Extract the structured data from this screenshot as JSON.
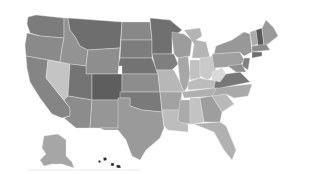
{
  "map": {
    "type": "choropleth",
    "region": "United States",
    "color_scheme": "grayscale",
    "background": "#ffffff",
    "states": [
      {
        "id": "WA",
        "fill": "#7c7c7c",
        "points": "28,17 36,15 64,18 64,38 40,36 30,33 27,24"
      },
      {
        "id": "OR",
        "fill": "#8a8a8a",
        "points": "27,33 40,36 64,38 62,48 60,62 26,56 25,45"
      },
      {
        "id": "CA",
        "fill": "#858585",
        "points": "26,56 48,60 46,78 70,108 70,116 62,118 52,114 40,98 30,82 27,68"
      },
      {
        "id": "NV",
        "fill": "#c4c4c4",
        "points": "48,60 70,64 68,96 64,100 46,78"
      },
      {
        "id": "ID",
        "fill": "#939393",
        "points": "64,18 68,18 70,30 76,38 80,46 88,50 86,66 70,64 60,62 62,48 64,38"
      },
      {
        "id": "MT",
        "fill": "#6e6e6e",
        "points": "68,18 122,22 120,48 88,50 80,46 76,38 70,30"
      },
      {
        "id": "WY",
        "fill": "#8e8e8e",
        "points": "88,50 120,48 118,74 86,74 86,66"
      },
      {
        "id": "UT",
        "fill": "#747474",
        "points": "70,64 86,66 86,74 92,74 92,100 68,96"
      },
      {
        "id": "AZ",
        "fill": "#8c8c8c",
        "points": "68,96 92,100 90,128 76,128 64,118 70,116 70,108 64,100"
      },
      {
        "id": "CO",
        "fill": "#5e5e5e",
        "points": "92,74 122,74 122,100 92,100"
      },
      {
        "id": "NM",
        "fill": "#969696",
        "points": "92,100 120,100 118,128 100,128 90,128"
      },
      {
        "id": "ND",
        "fill": "#888888",
        "points": "122,22 150,22 152,40 121,40"
      },
      {
        "id": "SD",
        "fill": "#7d7d7d",
        "points": "121,40 152,40 152,58 120,58"
      },
      {
        "id": "NE",
        "fill": "#737373",
        "points": "120,58 152,58 158,74 122,74 122,66 118,66"
      },
      {
        "id": "KS",
        "fill": "#8d8d8d",
        "points": "122,74 158,74 160,92 122,92"
      },
      {
        "id": "OK",
        "fill": "#7a7a7a",
        "points": "120,92 160,92 162,112 142,110 130,106 130,98 120,98"
      },
      {
        "id": "TX",
        "fill": "#9a9a9a",
        "points": "118,98 130,98 130,106 142,110 162,112 164,128 160,138 146,150 140,160 132,156 126,140 118,130 104,130 100,128 118,128"
      },
      {
        "id": "MN",
        "fill": "#707070",
        "points": "150,18 170,20 182,30 172,38 172,54 152,54 152,40"
      },
      {
        "id": "IA",
        "fill": "#7f7f7f",
        "points": "152,54 174,54 178,64 172,70 156,70"
      },
      {
        "id": "MO",
        "fill": "#b7b7b7",
        "points": "156,70 174,70 180,82 184,92 160,92 158,74"
      },
      {
        "id": "AR",
        "fill": "#a2a2a2",
        "points": "160,92 182,92 180,110 162,110"
      },
      {
        "id": "LA",
        "fill": "#bdbdbd",
        "points": "162,110 180,110 178,120 188,124 188,132 168,130 164,126"
      },
      {
        "id": "WI",
        "fill": "#9c9c9c",
        "points": "172,32 184,34 192,40 190,56 178,58 174,54 172,38"
      },
      {
        "id": "IL",
        "fill": "#a7a7a7",
        "points": "178,58 188,56 190,74 188,86 184,92 180,82 178,64"
      },
      {
        "id": "MI",
        "fill": "#b4b4b4",
        "points": "184,30 200,28 202,36 196,40 206,42 210,58 192,58 194,44 190,38"
      },
      {
        "id": "IN",
        "fill": "#c1c1c1",
        "points": "190,60 200,60 200,78 190,80"
      },
      {
        "id": "OH",
        "fill": "#c9c9c9",
        "points": "200,58 214,56 216,72 208,80 200,76"
      },
      {
        "id": "KY",
        "fill": "#bcbcbc",
        "points": "188,82 200,78 208,80 218,80 214,88 188,90"
      },
      {
        "id": "TN",
        "fill": "#b0b0b0",
        "points": "182,92 214,88 222,90 216,96 184,98"
      },
      {
        "id": "MS",
        "fill": "#aaaaaa",
        "points": "180,100 190,100 190,124 180,122 178,120"
      },
      {
        "id": "AL",
        "fill": "#c3c3c3",
        "points": "190,98 200,98 204,122 194,124 190,124"
      },
      {
        "id": "GA",
        "fill": "#9e9e9e",
        "points": "200,98 212,96 222,112 220,122 204,122"
      },
      {
        "id": "FL",
        "fill": "#b1b1b1",
        "points": "194,124 220,122 226,126 236,150 232,160 224,150 214,132 204,128"
      },
      {
        "id": "SC",
        "fill": "#b9b9b9",
        "points": "212,96 226,94 234,104 222,112"
      },
      {
        "id": "NC",
        "fill": "#a9a9a9",
        "points": "214,88 252,84 248,96 234,98 226,94 212,96 216,90"
      },
      {
        "id": "VA",
        "fill": "#777777",
        "points": "216,78 226,74 240,72 250,82 220,88 214,88"
      },
      {
        "id": "WV",
        "fill": "#d9d9d9",
        "points": "212,72 222,68 226,74 220,82 212,80"
      },
      {
        "id": "PA",
        "fill": "#a0a0a0",
        "points": "212,54 240,52 244,60 240,66 214,68"
      },
      {
        "id": "NY",
        "fill": "#989898",
        "points": "216,46 232,40 244,32 250,34 252,52 244,56 240,52 214,54"
      },
      {
        "id": "MD",
        "fill": "#8f8f8f",
        "points": "228,66 242,64 246,72 236,72"
      },
      {
        "id": "NJ",
        "fill": "#818181",
        "points": "244,58 250,58 248,70 242,66"
      },
      {
        "id": "VT",
        "fill": "#aaaaaa",
        "points": "250,32 256,30 258,44 252,46"
      },
      {
        "id": "NH",
        "fill": "#5a5a5a",
        "points": "256,30 262,28 264,46 258,46"
      },
      {
        "id": "ME",
        "fill": "#9a9a9a",
        "points": "262,28 266,20 274,28 278,36 268,44 264,46"
      },
      {
        "id": "MA",
        "fill": "#8b8b8b",
        "points": "252,46 266,44 270,50 252,52"
      },
      {
        "id": "CT",
        "fill": "#6f6f6f",
        "points": "252,52 262,52 262,56 252,58"
      },
      {
        "id": "AK",
        "fill": "#a6a6a6",
        "points": "44,136 58,134 66,140 66,156 72,162 74,168 62,164 52,164 44,166 40,160 46,154 42,148"
      },
      {
        "id": "HI",
        "fill": "#2a2a2a",
        "points": "98,161 100,160 101,162 99,163"
      },
      {
        "id": "HI2",
        "fill": "#2a2a2a",
        "points": "103,158 106,157 107,160 104,161"
      },
      {
        "id": "HI3",
        "fill": "#2a2a2a",
        "points": "111,163 114,163 114,166 111,166"
      },
      {
        "id": "HI4",
        "fill": "#2a2a2a",
        "points": "116,165 120,165 121,168 117,168"
      }
    ],
    "baseline": {
      "x1": 28,
      "y1": 170,
      "x2": 140,
      "y2": 170
    }
  }
}
